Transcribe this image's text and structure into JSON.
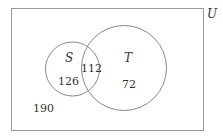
{
  "diagram": {
    "type": "venn",
    "universe_label": "U",
    "sets": [
      {
        "name": "S",
        "only_count": "126"
      },
      {
        "name": "T",
        "only_count": "72"
      }
    ],
    "intersection_count": "112",
    "outside_count": "190",
    "colors": {
      "stroke": "#888888",
      "text": "#333333"
    }
  }
}
